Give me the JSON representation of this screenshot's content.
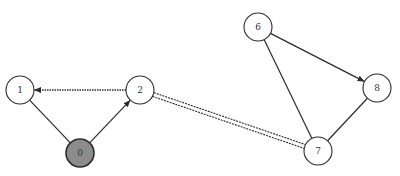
{
  "diagram": {
    "type": "graph",
    "nodes": [
      {
        "id": "0",
        "label": "0",
        "x": 80,
        "y": 153,
        "r": 14,
        "fill": "#8c8c8c",
        "highlighted": true
      },
      {
        "id": "1",
        "label": "1",
        "x": 20,
        "y": 90,
        "r": 14,
        "fill": "#ffffff",
        "highlighted": false
      },
      {
        "id": "2",
        "label": "2",
        "x": 140,
        "y": 90,
        "r": 14,
        "fill": "#ffffff",
        "highlighted": false
      },
      {
        "id": "6",
        "label": "6",
        "x": 258,
        "y": 27,
        "r": 14,
        "fill": "#ffffff",
        "highlighted": false
      },
      {
        "id": "7",
        "label": "7",
        "x": 318,
        "y": 151,
        "r": 14,
        "fill": "#ffffff",
        "highlighted": false
      },
      {
        "id": "8",
        "label": "8",
        "x": 377,
        "y": 88,
        "r": 14,
        "fill": "#ffffff",
        "highlighted": false
      }
    ],
    "edges": [
      {
        "from": "0",
        "to": "1",
        "style": "solid",
        "arrow": false
      },
      {
        "from": "0",
        "to": "2",
        "style": "solid",
        "arrow": true
      },
      {
        "from": "2",
        "to": "1",
        "style": "dotted",
        "arrow": true
      },
      {
        "from": "2",
        "to": "7",
        "style": "double-dashed",
        "arrow": false
      },
      {
        "from": "6",
        "to": "8",
        "style": "solid",
        "arrow": true
      },
      {
        "from": "6",
        "to": "7",
        "style": "solid",
        "arrow": false
      },
      {
        "from": "8",
        "to": "7",
        "style": "solid",
        "arrow": false
      }
    ],
    "colors": {
      "stroke": "#2b2b2b",
      "highlight_fill": "#8c8c8c",
      "node_fill": "#ffffff",
      "background": "#ffffff"
    }
  }
}
